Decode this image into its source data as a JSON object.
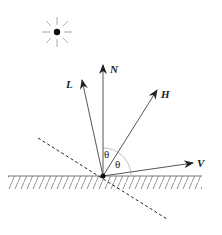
{
  "diagram": {
    "vectors": [
      {
        "id": "N",
        "label": "N",
        "meaning": "surface normal"
      },
      {
        "id": "L",
        "label": "L",
        "meaning": "light direction"
      },
      {
        "id": "H",
        "label": "H",
        "meaning": "half vector"
      },
      {
        "id": "V",
        "label": "V",
        "meaning": "view direction"
      }
    ],
    "angles": [
      {
        "label": "θ",
        "between": "N-H"
      },
      {
        "label": "θ",
        "between": "H-V"
      }
    ],
    "light_source": "sun-icon",
    "surface": "hatched plane",
    "mirror_line": "dashed"
  }
}
